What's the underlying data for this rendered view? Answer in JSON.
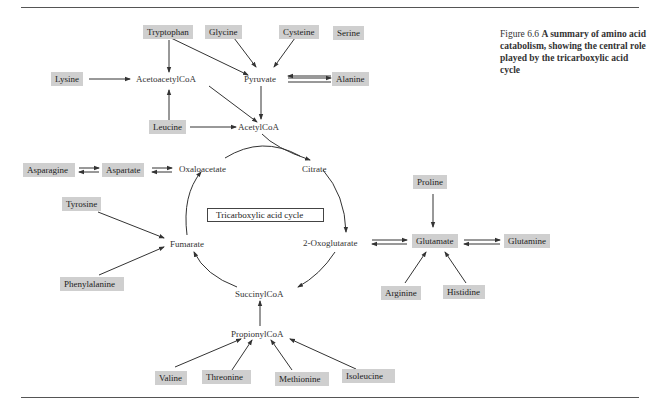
{
  "figure": {
    "number": "Figure 6.6",
    "caption": "A summary of amino acid catabolism, showing the central role played by the tricarboxylic acid cycle"
  },
  "cycle_label": "Tricarboxylic acid cycle",
  "amino_acids": {
    "tryptophan": "Tryptophan",
    "glycine": "Glycine",
    "cysteine": "Cysteine",
    "serine": "Serine",
    "lysine": "Lysine",
    "alanine": "Alanine",
    "leucine": "Leucine",
    "asparagine": "Asparagine",
    "aspartate": "Aspartate",
    "tyrosine": "Tyrosine",
    "phenylalanine": "Phenylalanine",
    "proline": "Proline",
    "glutamate": "Glutamate",
    "glutamine": "Glutamine",
    "arginine": "Arginine",
    "histidine": "Histidine",
    "valine": "Valine",
    "threonine": "Threonine",
    "methionine": "Methionine",
    "isoleucine": "Isoleucine"
  },
  "metabolites": {
    "acetoacetylcoa": "AcetoacetylCoA",
    "pyruvate": "Pyruvate",
    "acetylcoa": "AcetylCoA",
    "oxaloacetate": "Oxaloacetate",
    "citrate": "Citrate",
    "fumarate": "Fumarate",
    "oxoglutarate": "2-Oxoglutarate",
    "succinylcoa": "SuccinylCoA",
    "propionylcoa": "PropionylCoA"
  }
}
